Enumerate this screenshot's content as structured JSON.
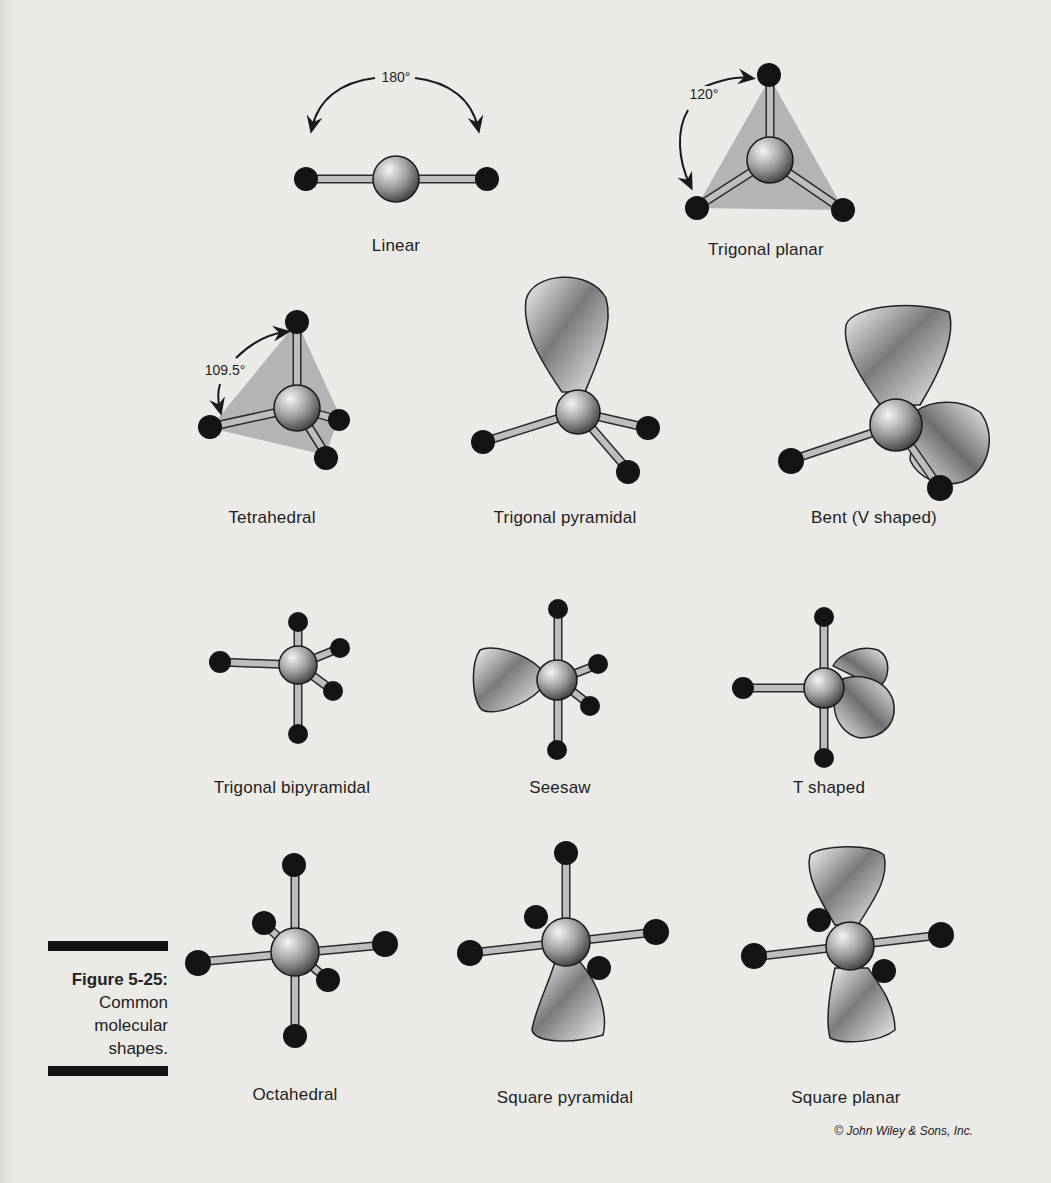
{
  "figure": {
    "number_label": "Figure 5-25:",
    "caption_lines": [
      "Common",
      "molecular",
      "shapes."
    ],
    "credit": "© John Wiley & Sons, Inc."
  },
  "shapes": [
    {
      "name": "Linear",
      "angle_label": "180°"
    },
    {
      "name": "Trigonal planar",
      "angle_label": "120°"
    },
    {
      "name": "Tetrahedral",
      "angle_label": "109.5°"
    },
    {
      "name": "Trigonal pyramidal"
    },
    {
      "name": "Bent (V shaped)"
    },
    {
      "name": "Trigonal bipyramidal"
    },
    {
      "name": "Seesaw"
    },
    {
      "name": "T shaped"
    },
    {
      "name": "Octahedral"
    },
    {
      "name": "Square pyramidal"
    },
    {
      "name": "Square planar"
    }
  ],
  "colors": {
    "background": "#ebeae7",
    "atom_outer": "#141414",
    "bond": "#b9b9b9",
    "plane": "#b3b3b3",
    "center_light": "#f2f2f2",
    "center_dark": "#4a4a4a"
  }
}
